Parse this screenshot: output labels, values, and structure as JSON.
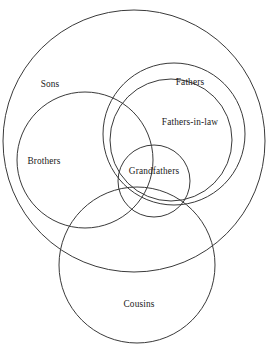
{
  "diagram": {
    "type": "venn-euler-diagram",
    "background_color": "#ffffff",
    "stroke_color": "#3a3a3a",
    "text_color": "#1a1a1a",
    "canvas": {
      "width": 272,
      "height": 353
    },
    "sets": [
      {
        "id": "sons",
        "label": "Sons",
        "shape": "circle",
        "cx": 134,
        "cy": 141,
        "r": 131,
        "label_x": 50,
        "label_y": 85
      },
      {
        "id": "brothers",
        "label": "Brothers",
        "shape": "circle",
        "cx": 85,
        "cy": 160,
        "r": 68,
        "label_x": 44,
        "label_y": 162
      },
      {
        "id": "fathers",
        "label": "Fathers",
        "shape": "circle",
        "cx": 174,
        "cy": 134,
        "r": 71,
        "label_x": 190,
        "label_y": 83
      },
      {
        "id": "fathers-in-law",
        "label": "Fathers-in-law",
        "shape": "circle",
        "cx": 171,
        "cy": 140,
        "r": 61,
        "label_x": 190,
        "label_y": 123
      },
      {
        "id": "grandfathers",
        "label": "Grandfathers",
        "shape": "circle",
        "cx": 154,
        "cy": 181,
        "r": 36,
        "label_x": 154,
        "label_y": 172
      },
      {
        "id": "cousins",
        "label": "Cousins",
        "shape": "circle",
        "cx": 137,
        "cy": 265,
        "r": 78,
        "label_x": 139,
        "label_y": 305
      }
    ]
  }
}
